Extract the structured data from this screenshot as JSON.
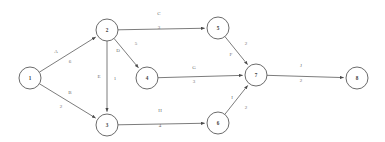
{
  "chart_data": {
    "type": "diagram",
    "diagram_kind": "directed-weighted-network",
    "title": "",
    "background_color": "#ffffff",
    "node_stroke_color": "#5a5a5a",
    "edge_color": "#5a5a5a",
    "label_color": "#6e6e6e",
    "node_radius": 11,
    "nodes": [
      {
        "id": "1",
        "label": "1",
        "x": 30,
        "y": 78
      },
      {
        "id": "2",
        "label": "2",
        "x": 107,
        "y": 30
      },
      {
        "id": "3",
        "label": "3",
        "x": 107,
        "y": 125
      },
      {
        "id": "4",
        "label": "4",
        "x": 147,
        "y": 78
      },
      {
        "id": "5",
        "label": "5",
        "x": 218,
        "y": 28
      },
      {
        "id": "6",
        "label": "6",
        "x": 218,
        "y": 123
      },
      {
        "id": "7",
        "label": "7",
        "x": 256,
        "y": 75
      },
      {
        "id": "8",
        "label": "8",
        "x": 357,
        "y": 78
      }
    ],
    "edges": [
      {
        "id": "edge-1-2",
        "from": "1",
        "to": "2",
        "letter": "A",
        "weight": "6",
        "letter_x": 56,
        "letter_y": 51,
        "weight_x": 70,
        "weight_y": 61
      },
      {
        "id": "edge-1-3",
        "from": "1",
        "to": "3",
        "letter": "B",
        "weight": "2",
        "letter_x": 70,
        "letter_y": 92,
        "weight_x": 61,
        "weight_y": 106
      },
      {
        "id": "edge-2-5",
        "from": "2",
        "to": "5",
        "letter": "C",
        "weight": "3",
        "letter_x": 159,
        "letter_y": 13,
        "weight_x": 159,
        "weight_y": 27
      },
      {
        "id": "edge-2-4",
        "from": "2",
        "to": "4",
        "letter": "D",
        "weight": "5",
        "letter_x": 118,
        "letter_y": 50,
        "weight_x": 136,
        "weight_y": 43
      },
      {
        "id": "edge-2-3",
        "from": "2",
        "to": "3",
        "letter": "E",
        "weight": "1",
        "letter_x": 99,
        "letter_y": 76,
        "weight_x": 115,
        "weight_y": 78
      },
      {
        "id": "edge-4-7",
        "from": "4",
        "to": "7",
        "letter": "G",
        "weight": "3",
        "letter_x": 194,
        "letter_y": 67,
        "weight_x": 194,
        "weight_y": 81
      },
      {
        "id": "edge-3-6",
        "from": "3",
        "to": "6",
        "letter": "H",
        "weight": "4",
        "letter_x": 160,
        "letter_y": 110,
        "weight_x": 160,
        "weight_y": 125
      },
      {
        "id": "edge-5-7",
        "from": "5",
        "to": "7",
        "letter": "F",
        "weight": "2",
        "letter_x": 231,
        "letter_y": 54,
        "weight_x": 246,
        "weight_y": 43
      },
      {
        "id": "edge-6-7",
        "from": "6",
        "to": "7",
        "letter": "I",
        "weight": "2",
        "letter_x": 232,
        "letter_y": 97,
        "weight_x": 246,
        "weight_y": 107
      },
      {
        "id": "edge-7-8",
        "from": "7",
        "to": "8",
        "letter": "J",
        "weight": "2",
        "letter_x": 301,
        "letter_y": 65,
        "weight_x": 301,
        "weight_y": 80
      }
    ]
  }
}
